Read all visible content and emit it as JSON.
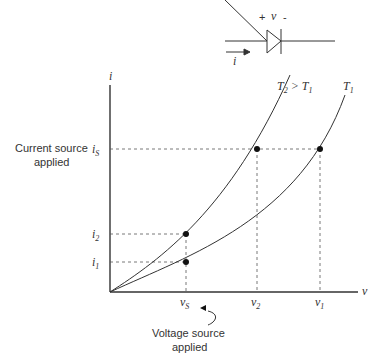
{
  "diode": {
    "plus": "+",
    "voltage": "v",
    "minus": "-",
    "current": "i"
  },
  "axes": {
    "y_label": "i",
    "x_label": "v"
  },
  "y_ticks": {
    "iS": {
      "base": "i",
      "sub": "S"
    },
    "i2": {
      "base": "i",
      "sub": "2"
    },
    "i1": {
      "base": "i",
      "sub": "1"
    }
  },
  "x_ticks": {
    "vS": {
      "base": "v",
      "sub": "S"
    },
    "v2": {
      "base": "v",
      "sub": "2"
    },
    "v1": {
      "base": "v",
      "sub": "1"
    }
  },
  "curves": {
    "t2": {
      "t": "T",
      "sub": "2",
      "gt": " > ",
      "t_b": "T",
      "sub_b": "1"
    },
    "t1": {
      "t": "T",
      "sub": "1"
    }
  },
  "annotations": {
    "current_source_line1": "Current source",
    "current_source_line2": "applied",
    "voltage_source_line1": "Voltage source",
    "voltage_source_line2": "applied"
  }
}
